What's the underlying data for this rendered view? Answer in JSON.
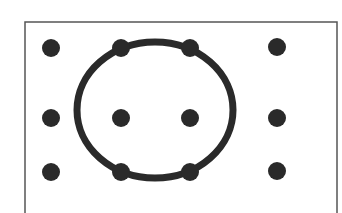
{
  "diagram": {
    "colors": {
      "background": "#ffffff",
      "frame": "#555555",
      "dot": "#2a2a2a",
      "circle": "#2a2a2a"
    },
    "frame": {
      "x": 25,
      "y": 22,
      "width": 312,
      "height": 200
    },
    "dot_radius": 9,
    "dots": [
      {
        "row": 0,
        "col": 0,
        "x": 51,
        "y": 48
      },
      {
        "row": 0,
        "col": 1,
        "x": 121,
        "y": 48
      },
      {
        "row": 0,
        "col": 2,
        "x": 190,
        "y": 48
      },
      {
        "row": 0,
        "col": 3,
        "x": 277,
        "y": 47
      },
      {
        "row": 1,
        "col": 0,
        "x": 51,
        "y": 118
      },
      {
        "row": 1,
        "col": 1,
        "x": 121,
        "y": 118
      },
      {
        "row": 1,
        "col": 2,
        "x": 190,
        "y": 118
      },
      {
        "row": 1,
        "col": 3,
        "x": 277,
        "y": 118
      },
      {
        "row": 2,
        "col": 0,
        "x": 51,
        "y": 172
      },
      {
        "row": 2,
        "col": 1,
        "x": 121,
        "y": 172
      },
      {
        "row": 2,
        "col": 2,
        "x": 190,
        "y": 172
      },
      {
        "row": 2,
        "col": 3,
        "x": 277,
        "y": 171
      }
    ],
    "circle": {
      "cx": 155,
      "cy": 110,
      "rx": 78,
      "ry": 68,
      "stroke_width": 7
    }
  }
}
